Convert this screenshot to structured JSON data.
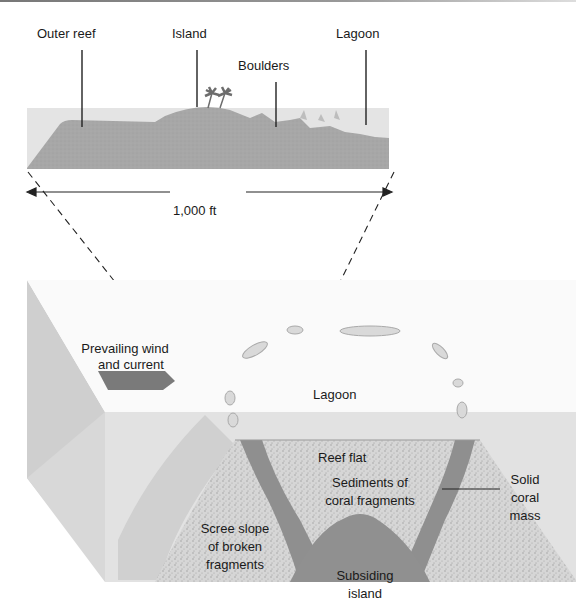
{
  "top_section": {
    "labels": {
      "outer_reef": "Outer reef",
      "island": "Island",
      "boulders": "Boulders",
      "lagoon": "Lagoon"
    },
    "scale": "1,000 ft"
  },
  "bottom_section": {
    "wind_label_line1": "Prevailing wind",
    "wind_label_line2": "and current",
    "lagoon": "Lagoon",
    "reef_flat": "Reef flat",
    "sediments_line1": "Sediments of",
    "sediments_line2": "coral fragments",
    "solid_line1": "Solid",
    "solid_line2": "coral",
    "solid_line3": "mass",
    "scree_line1": "Scree slope",
    "scree_line2": "of broken",
    "scree_line3": "fragments",
    "subsiding_line1": "Subsiding",
    "subsiding_line2": "island"
  },
  "colors": {
    "water": "#e2e2e2",
    "reef": "#a9a9a9",
    "sediment": "#d4d4d4",
    "solid_coral": "#8c8c8c",
    "arrow": "#7a7a7a"
  }
}
